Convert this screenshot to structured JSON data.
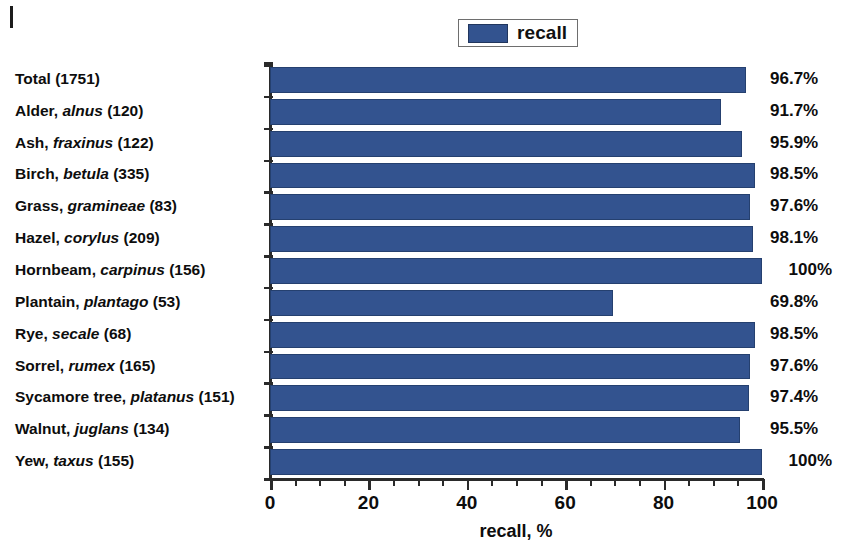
{
  "legend": {
    "label": "recall",
    "swatch_color": "#33538f",
    "position": "top-center"
  },
  "axis": {
    "x_title": "recall, %",
    "x_ticks": [
      "0",
      "20",
      "40",
      "60",
      "80",
      "100"
    ],
    "x_min": 0,
    "x_max": 100,
    "x_minor_step": 5
  },
  "chart_data": {
    "type": "bar",
    "orientation": "horizontal",
    "title": "",
    "xlabel": "recall, %",
    "ylabel": "",
    "xlim": [
      0,
      100
    ],
    "grid": false,
    "legend": [
      "recall"
    ],
    "legend_position": "top-center",
    "categories": [
      "Total (1751)",
      "Alder, alnus (120)",
      "Ash, fraxinus (122)",
      "Birch, betula (335)",
      "Grass, gramineae (83)",
      "Hazel, corylus (209)",
      "Hornbeam, carpinus (156)",
      "Plantain, plantago (53)",
      "Rye, secale (68)",
      "Sorrel, rumex (165)",
      "Sycamore tree, platanus (151)",
      "Walnut, juglans (134)",
      "Yew, taxus (155)"
    ],
    "category_parts": [
      {
        "common": "Total",
        "scientific": "",
        "count": "(1751)"
      },
      {
        "common": "Alder,",
        "scientific": "alnus",
        "count": "(120)"
      },
      {
        "common": "Ash,",
        "scientific": "fraxinus",
        "count": "(122)"
      },
      {
        "common": "Birch,",
        "scientific": "betula",
        "count": "(335)"
      },
      {
        "common": "Grass,",
        "scientific": "gramineae",
        "count": "(83)"
      },
      {
        "common": "Hazel,",
        "scientific": "corylus",
        "count": "(209)"
      },
      {
        "common": "Hornbeam,",
        "scientific": "carpinus",
        "count": "(156)"
      },
      {
        "common": "Plantain,",
        "scientific": "plantago",
        "count": "(53)"
      },
      {
        "common": "Rye,",
        "scientific": "secale",
        "count": "(68)"
      },
      {
        "common": "Sorrel,",
        "scientific": "rumex",
        "count": "(165)"
      },
      {
        "common": "Sycamore tree,",
        "scientific": "platanus",
        "count": "(151)"
      },
      {
        "common": "Walnut,",
        "scientific": "juglans",
        "count": "(134)"
      },
      {
        "common": "Yew,",
        "scientific": "taxus",
        "count": "(155)"
      }
    ],
    "values": [
      96.7,
      91.7,
      95.9,
      98.5,
      97.6,
      98.1,
      100,
      69.8,
      98.5,
      97.6,
      97.4,
      95.5,
      100
    ],
    "value_labels": [
      "96.7%",
      "91.7%",
      "95.9%",
      "98.5%",
      "97.6%",
      "98.1%",
      "100%",
      "69.8%",
      "98.5%",
      "97.6%",
      "97.4%",
      "95.5%",
      "100%"
    ],
    "series": [
      {
        "name": "recall",
        "color": "#33538f",
        "values": [
          96.7,
          91.7,
          95.9,
          98.5,
          97.6,
          98.1,
          100,
          69.8,
          98.5,
          97.6,
          97.4,
          95.5,
          100
        ]
      }
    ]
  }
}
